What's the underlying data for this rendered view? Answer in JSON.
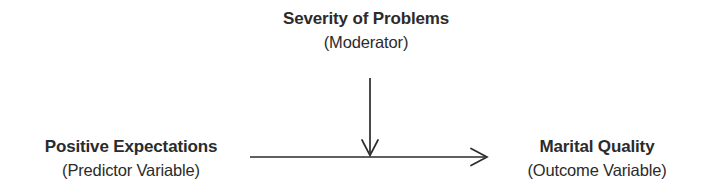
{
  "diagram": {
    "type": "moderation-model",
    "background_color": "#ffffff",
    "stroke_color": "#2b2b2b",
    "text_color": "#2b2b2b",
    "nodes": {
      "moderator": {
        "title": "Severity of Problems",
        "subtitle": "(Moderator)",
        "role": "Moderator"
      },
      "predictor": {
        "title": "Positive Expectations",
        "subtitle": "(Predictor Variable)",
        "role": "Predictor Variable"
      },
      "outcome": {
        "title": "Marital Quality",
        "subtitle": "(Outcome Variable)",
        "role": "Outcome Variable"
      }
    },
    "arrows": [
      {
        "name": "predictor-to-outcome-arrow",
        "from": "predictor",
        "to": "outcome",
        "orientation": "horizontal",
        "head": "open-v"
      },
      {
        "name": "moderator-to-path-arrow",
        "from": "moderator",
        "to": "predictor-to-outcome-path",
        "orientation": "vertical",
        "head": "open-v"
      }
    ]
  }
}
